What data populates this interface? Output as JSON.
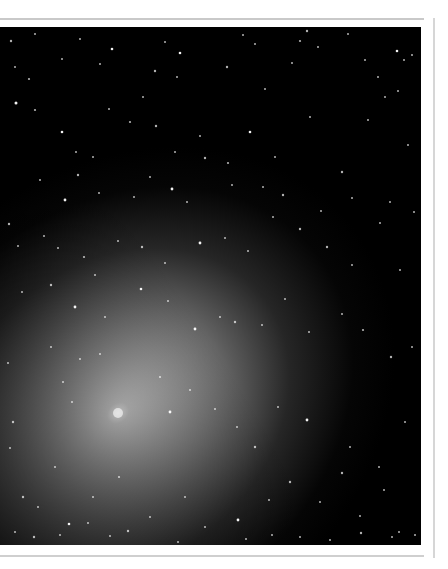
{
  "image": {
    "subject": "comet with diffuse coma against star field",
    "alt": "Comet with bright nucleus and diffuse gray coma over a dense star field",
    "colors": {
      "sky": "#000000",
      "coma_core": "#e6e6e6",
      "coma_mid": "#8a8a8a",
      "coma_outer": "#3a3a3a",
      "star": "#ffffff",
      "frame_rule": "#c9c9c9"
    },
    "nucleus": {
      "x": 118,
      "y": 386
    },
    "stars": [
      [
        11,
        14,
        1.2
      ],
      [
        35,
        7,
        1.0
      ],
      [
        80,
        12,
        1.0
      ],
      [
        112,
        22,
        1.3
      ],
      [
        165,
        15,
        1.0
      ],
      [
        180,
        26,
        1.3
      ],
      [
        243,
        8,
        1.0
      ],
      [
        255,
        17,
        1.0
      ],
      [
        300,
        14,
        1.1
      ],
      [
        307,
        4,
        1.2
      ],
      [
        318,
        20,
        1.0
      ],
      [
        348,
        7,
        1.0
      ],
      [
        397,
        24,
        1.3
      ],
      [
        412,
        28,
        1.0
      ],
      [
        15,
        40,
        1.0
      ],
      [
        29,
        52,
        1.1
      ],
      [
        62,
        32,
        1.0
      ],
      [
        100,
        37,
        1.0
      ],
      [
        155,
        44,
        1.2
      ],
      [
        177,
        50,
        1.0
      ],
      [
        227,
        40,
        1.2
      ],
      [
        265,
        62,
        1.0
      ],
      [
        292,
        36,
        1.0
      ],
      [
        365,
        33,
        1.0
      ],
      [
        378,
        50,
        1.0
      ],
      [
        398,
        64,
        1.0
      ],
      [
        404,
        33,
        1.0
      ],
      [
        16,
        76,
        1.5
      ],
      [
        35,
        83,
        1.1
      ],
      [
        62,
        105,
        1.3
      ],
      [
        76,
        125,
        1.0
      ],
      [
        93,
        130,
        1.0
      ],
      [
        109,
        82,
        1.0
      ],
      [
        130,
        95,
        1.1
      ],
      [
        143,
        70,
        1.0
      ],
      [
        156,
        99,
        1.2
      ],
      [
        175,
        125,
        1.0
      ],
      [
        200,
        109,
        1.0
      ],
      [
        228,
        136,
        1.1
      ],
      [
        250,
        105,
        1.3
      ],
      [
        275,
        130,
        1.0
      ],
      [
        310,
        90,
        1.0
      ],
      [
        342,
        145,
        1.2
      ],
      [
        368,
        93,
        1.0
      ],
      [
        385,
        70,
        1.0
      ],
      [
        408,
        118,
        1.0
      ],
      [
        40,
        153,
        1.0
      ],
      [
        65,
        173,
        1.4
      ],
      [
        78,
        148,
        1.2
      ],
      [
        99,
        166,
        1.0
      ],
      [
        134,
        170,
        1.0
      ],
      [
        150,
        150,
        1.0
      ],
      [
        172,
        162,
        1.4
      ],
      [
        187,
        175,
        1.0
      ],
      [
        205,
        131,
        1.2
      ],
      [
        232,
        158,
        1.0
      ],
      [
        263,
        160,
        1.0
      ],
      [
        283,
        168,
        1.2
      ],
      [
        321,
        184,
        1.0
      ],
      [
        352,
        171,
        1.0
      ],
      [
        390,
        175,
        1.0
      ],
      [
        414,
        185,
        1.0
      ],
      [
        9,
        197,
        1.2
      ],
      [
        18,
        219,
        1.0
      ],
      [
        44,
        209,
        1.0
      ],
      [
        58,
        221,
        1.0
      ],
      [
        84,
        230,
        1.1
      ],
      [
        95,
        248,
        1.0
      ],
      [
        118,
        214,
        1.0
      ],
      [
        142,
        220,
        1.2
      ],
      [
        165,
        236,
        1.0
      ],
      [
        200,
        216,
        1.4
      ],
      [
        225,
        211,
        1.0
      ],
      [
        248,
        224,
        1.0
      ],
      [
        273,
        190,
        1.0
      ],
      [
        300,
        202,
        1.2
      ],
      [
        327,
        220,
        1.2
      ],
      [
        352,
        238,
        1.0
      ],
      [
        380,
        196,
        1.0
      ],
      [
        400,
        243,
        1.0
      ],
      [
        22,
        265,
        1.0
      ],
      [
        51,
        258,
        1.2
      ],
      [
        75,
        280,
        1.4
      ],
      [
        105,
        290,
        1.0
      ],
      [
        141,
        262,
        1.3
      ],
      [
        168,
        274,
        1.0
      ],
      [
        195,
        302,
        1.4
      ],
      [
        220,
        290,
        1.0
      ],
      [
        235,
        295,
        1.2
      ],
      [
        262,
        298,
        1.0
      ],
      [
        285,
        272,
        1.0
      ],
      [
        309,
        305,
        1.0
      ],
      [
        342,
        287,
        1.0
      ],
      [
        363,
        303,
        1.1
      ],
      [
        391,
        330,
        1.2
      ],
      [
        412,
        320,
        1.0
      ],
      [
        8,
        336,
        1.0
      ],
      [
        13,
        395,
        1.2
      ],
      [
        51,
        320,
        1.0
      ],
      [
        63,
        355,
        1.0
      ],
      [
        72,
        375,
        1.0
      ],
      [
        80,
        332,
        1.0
      ],
      [
        100,
        327,
        1.0
      ],
      [
        160,
        350,
        1.1
      ],
      [
        170,
        385,
        1.4
      ],
      [
        190,
        363,
        1.0
      ],
      [
        215,
        382,
        1.0
      ],
      [
        237,
        400,
        1.0
      ],
      [
        255,
        420,
        1.2
      ],
      [
        278,
        380,
        1.0
      ],
      [
        307,
        393,
        1.4
      ],
      [
        350,
        420,
        1.0
      ],
      [
        379,
        440,
        1.0
      ],
      [
        405,
        395,
        1.0
      ],
      [
        10,
        421,
        1.0
      ],
      [
        23,
        470,
        1.2
      ],
      [
        38,
        480,
        1.0
      ],
      [
        55,
        440,
        1.0
      ],
      [
        69,
        497,
        1.3
      ],
      [
        93,
        470,
        1.0
      ],
      [
        119,
        450,
        1.1
      ],
      [
        150,
        490,
        1.0
      ],
      [
        162,
        520,
        1.4
      ],
      [
        185,
        470,
        1.0
      ],
      [
        205,
        500,
        1.0
      ],
      [
        238,
        493,
        1.4
      ],
      [
        269,
        473,
        1.0
      ],
      [
        290,
        455,
        1.2
      ],
      [
        320,
        475,
        1.0
      ],
      [
        342,
        446,
        1.2
      ],
      [
        360,
        489,
        1.0
      ],
      [
        384,
        463,
        1.0
      ],
      [
        399,
        505,
        1.0
      ],
      [
        15,
        505,
        1.0
      ],
      [
        34,
        510,
        1.2
      ],
      [
        60,
        508,
        1.0
      ],
      [
        88,
        496,
        1.0
      ],
      [
        110,
        509,
        1.0
      ],
      [
        128,
        504,
        1.2
      ],
      [
        178,
        515,
        1.0
      ],
      [
        246,
        512,
        1.0
      ],
      [
        272,
        508,
        1.0
      ],
      [
        300,
        510,
        1.0
      ],
      [
        330,
        513,
        1.0
      ],
      [
        361,
        506,
        1.2
      ],
      [
        392,
        510,
        1.0
      ],
      [
        415,
        508,
        1.0
      ]
    ]
  }
}
